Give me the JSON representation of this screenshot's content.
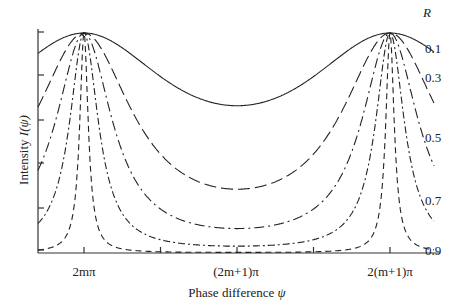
{
  "chart_data": {
    "type": "line",
    "title": "",
    "xlabel": "Phase difference ψ",
    "ylabel": "Intensity I(ψ)",
    "legend_title": "R",
    "x_tick_labels": [
      "2mπ",
      "(2m+1)π",
      "2(m+1)π"
    ],
    "x_range_phase": [
      -0.35,
      2.35
    ],
    "ylim": [
      0,
      1
    ],
    "grid": false,
    "formula": "I = 1 / (1 + F sin^2(ψ/2)), F = 4R/(1-R)^2",
    "series": [
      {
        "name": "0.1",
        "R": 0.1,
        "style": "solid",
        "min_intensity": 0.669,
        "max_intensity": 1.0
      },
      {
        "name": "0.3",
        "R": 0.3,
        "style": "long-dash",
        "min_intensity": 0.29,
        "max_intensity": 1.0
      },
      {
        "name": "0.5",
        "R": 0.5,
        "style": "dash-dot",
        "min_intensity": 0.111,
        "max_intensity": 1.0
      },
      {
        "name": "0.7",
        "R": 0.7,
        "style": "dash-dot-long",
        "min_intensity": 0.031,
        "max_intensity": 1.0
      },
      {
        "name": "0.9",
        "R": 0.9,
        "style": "dash",
        "min_intensity": 0.003,
        "max_intensity": 1.0
      }
    ],
    "peaks_at": [
      "2mπ",
      "2(m+1)π"
    ],
    "minimum_at": "(2m+1)π"
  },
  "labels": {
    "legend_title": "R",
    "xlabel_text": "Phase difference ",
    "xlabel_var": "ψ",
    "ylabel_text": "Intensity ",
    "ylabel_var": "I(ψ)",
    "x_tick_0": "2mπ",
    "x_tick_1": "(2m+1)π",
    "x_tick_2": "2(m+1)π",
    "r_labels": [
      "0.1",
      "0.3",
      "0.5",
      "0.7",
      "0.9"
    ]
  }
}
